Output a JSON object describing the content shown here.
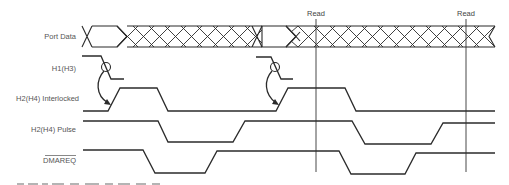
{
  "diagram": {
    "type": "timing-diagram",
    "signals": [
      {
        "id": "port_data",
        "label": "Port Data"
      },
      {
        "id": "h1",
        "label": "H1(H3)"
      },
      {
        "id": "h2_interlocked",
        "label": "H2(H4)  Interlocked"
      },
      {
        "id": "h2_pulse",
        "label": "H2(H4) Pulse"
      },
      {
        "id": "dmareq",
        "label": "DMAREQ",
        "overline": true
      }
    ],
    "markers": [
      {
        "label": "Read",
        "x": 316
      },
      {
        "label": "Read",
        "x": 466
      }
    ],
    "caption_partial": "Port A Data Read Timing"
  }
}
